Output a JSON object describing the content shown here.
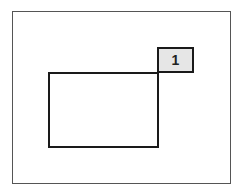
{
  "diagram": {
    "outer_frame": {
      "border_color": "#555555"
    },
    "rectangle": {
      "border_color": "#1a1a1a"
    },
    "label": {
      "text": "1",
      "background": "#e6e6e6"
    }
  }
}
